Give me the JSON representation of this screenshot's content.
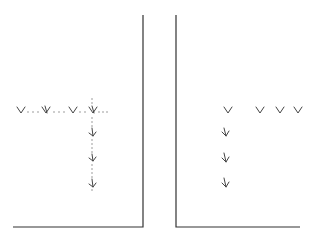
{
  "diagram": {
    "panels": [
      {
        "id": "left",
        "description": "Dotted grid path: horizontal row of marks with dotted connectors, vertical dotted column with downward arrow marks",
        "row_marks": [
          "Y",
          "X",
          "Y",
          "X"
        ],
        "column_marks": [
          "arrow-down",
          "arrow-down",
          "arrow-down"
        ],
        "dotted": true
      },
      {
        "id": "right",
        "description": "Same marks without dotted connectors",
        "row_marks": [
          "Y",
          "Y",
          "Y",
          "Y"
        ],
        "column_marks": [
          "arrow-down",
          "arrow-down",
          "arrow-down"
        ],
        "dotted": false
      }
    ],
    "colors": {
      "line": "#333333",
      "mark": "#444444",
      "dot": "#777777"
    }
  }
}
